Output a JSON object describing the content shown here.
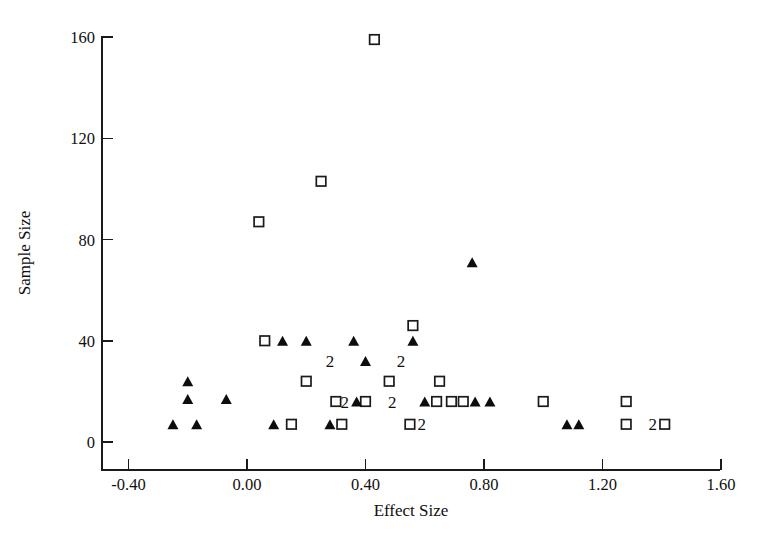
{
  "chart_data": {
    "type": "scatter",
    "title": "",
    "xlabel": "Effect Size",
    "ylabel": "Sample Size",
    "xlim": [
      -0.55,
      1.65
    ],
    "ylim": [
      -8,
      172
    ],
    "xticks": [
      -0.4,
      0.0,
      0.4,
      0.8,
      1.2,
      1.6
    ],
    "xticklabels": [
      "-0.40",
      "0.00",
      "0.40",
      "0.80",
      "1.20",
      "1.60"
    ],
    "yticks": [
      0,
      40,
      80,
      120,
      160
    ],
    "yticklabels": [
      "0",
      "40",
      "80",
      "120",
      "160"
    ],
    "grid": false,
    "legend": "none",
    "series": [
      {
        "name": "open-square",
        "marker": "open_square",
        "points": [
          {
            "x": 0.43,
            "y": 159
          },
          {
            "x": 0.25,
            "y": 103
          },
          {
            "x": 0.04,
            "y": 87
          },
          {
            "x": 0.56,
            "y": 46
          },
          {
            "x": 0.06,
            "y": 40
          },
          {
            "x": 0.2,
            "y": 24
          },
          {
            "x": 0.48,
            "y": 24
          },
          {
            "x": 0.65,
            "y": 24
          },
          {
            "x": 1.0,
            "y": 16
          },
          {
            "x": 1.28,
            "y": 16
          },
          {
            "x": 0.3,
            "y": 16
          },
          {
            "x": 0.4,
            "y": 16
          },
          {
            "x": 0.64,
            "y": 16
          },
          {
            "x": 0.69,
            "y": 16
          },
          {
            "x": 0.73,
            "y": 16
          },
          {
            "x": 1.28,
            "y": 7
          },
          {
            "x": 1.41,
            "y": 7
          },
          {
            "x": 0.15,
            "y": 7
          },
          {
            "x": 0.32,
            "y": 7
          },
          {
            "x": 0.55,
            "y": 7
          }
        ]
      },
      {
        "name": "filled-triangle",
        "marker": "filled_triangle",
        "points": [
          {
            "x": 0.76,
            "y": 71
          },
          {
            "x": 0.12,
            "y": 40
          },
          {
            "x": 0.2,
            "y": 40
          },
          {
            "x": 0.36,
            "y": 40
          },
          {
            "x": 0.56,
            "y": 40
          },
          {
            "x": 0.4,
            "y": 32
          },
          {
            "x": -0.2,
            "y": 24
          },
          {
            "x": -0.2,
            "y": 17
          },
          {
            "x": -0.07,
            "y": 17
          },
          {
            "x": 0.37,
            "y": 16
          },
          {
            "x": 0.6,
            "y": 16
          },
          {
            "x": 0.77,
            "y": 16
          },
          {
            "x": 0.82,
            "y": 16
          },
          {
            "x": -0.25,
            "y": 7
          },
          {
            "x": -0.17,
            "y": 7
          },
          {
            "x": 0.09,
            "y": 7
          },
          {
            "x": 0.28,
            "y": 7
          },
          {
            "x": 1.08,
            "y": 7
          },
          {
            "x": 1.12,
            "y": 7
          }
        ]
      }
    ],
    "overlap_labels": [
      {
        "x": 0.28,
        "y": 32,
        "text": "2"
      },
      {
        "x": 0.52,
        "y": 32,
        "text": "2"
      },
      {
        "x": 0.33,
        "y": 16,
        "text": "2"
      },
      {
        "x": 0.49,
        "y": 16,
        "text": "2"
      },
      {
        "x": 0.59,
        "y": 7,
        "text": "2"
      },
      {
        "x": 1.37,
        "y": 7,
        "text": "2"
      }
    ]
  },
  "axes": {
    "xlabel": "Effect Size",
    "ylabel": "Sample Size"
  }
}
